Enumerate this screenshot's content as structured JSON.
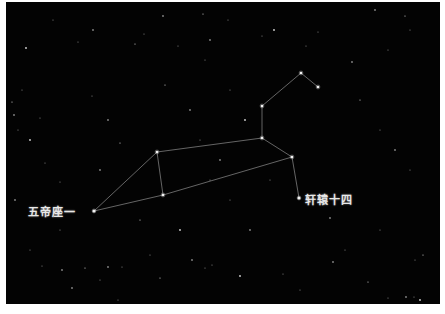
{
  "image": {
    "subject": "star-chart-constellation",
    "background_color": "#030303",
    "line_color": "#bdbdbd",
    "star_color": "#f2f2f2"
  },
  "labels": [
    {
      "text": "五帝座一",
      "x": 28,
      "y": 203
    },
    {
      "text": "轩辕十四",
      "x": 305,
      "y": 191
    }
  ],
  "constellation": {
    "vertices": {
      "A": [
        94,
        211
      ],
      "B": [
        157,
        152
      ],
      "C": [
        163,
        195
      ],
      "D": [
        262,
        138
      ],
      "E": [
        292,
        157
      ],
      "F": [
        299,
        198
      ],
      "G": [
        262,
        106
      ],
      "H": [
        301,
        73
      ],
      "I": [
        318,
        87
      ]
    },
    "edges": [
      [
        "A",
        "B"
      ],
      [
        "A",
        "C"
      ],
      [
        "B",
        "C"
      ],
      [
        "B",
        "D"
      ],
      [
        "C",
        "E"
      ],
      [
        "D",
        "E"
      ],
      [
        "E",
        "F"
      ],
      [
        "D",
        "G"
      ],
      [
        "G",
        "H"
      ],
      [
        "H",
        "I"
      ]
    ]
  },
  "background_stars": [
    [
      26,
      48
    ],
    [
      53,
      20
    ],
    [
      78,
      42
    ],
    [
      93,
      30
    ],
    [
      135,
      44
    ],
    [
      144,
      34
    ],
    [
      163,
      16
    ],
    [
      178,
      46
    ],
    [
      203,
      14
    ],
    [
      210,
      40
    ],
    [
      228,
      20
    ],
    [
      262,
      36
    ],
    [
      274,
      30
    ],
    [
      306,
      46
    ],
    [
      318,
      32
    ],
    [
      375,
      10
    ],
    [
      405,
      16
    ],
    [
      410,
      30
    ],
    [
      352,
      62
    ],
    [
      388,
      50
    ],
    [
      12,
      102
    ],
    [
      14,
      115
    ],
    [
      22,
      90
    ],
    [
      18,
      130
    ],
    [
      30,
      140
    ],
    [
      40,
      118
    ],
    [
      92,
      96
    ],
    [
      108,
      120
    ],
    [
      120,
      143
    ],
    [
      45,
      163
    ],
    [
      100,
      170
    ],
    [
      60,
      182
    ],
    [
      165,
      85
    ],
    [
      190,
      110
    ],
    [
      205,
      60
    ],
    [
      230,
      90
    ],
    [
      245,
      120
    ],
    [
      210,
      180
    ],
    [
      230,
      200
    ],
    [
      250,
      230
    ],
    [
      360,
      100
    ],
    [
      380,
      130
    ],
    [
      395,
      150
    ],
    [
      410,
      170
    ],
    [
      350,
      200
    ],
    [
      330,
      218
    ],
    [
      380,
      230
    ],
    [
      415,
      260
    ],
    [
      420,
      300
    ],
    [
      345,
      250
    ],
    [
      42,
      266
    ],
    [
      62,
      270
    ],
    [
      85,
      268
    ],
    [
      100,
      280
    ],
    [
      108,
      267
    ],
    [
      122,
      267
    ],
    [
      160,
      278
    ],
    [
      192,
      260
    ],
    [
      205,
      268
    ],
    [
      212,
      265
    ],
    [
      240,
      276
    ],
    [
      283,
      274
    ],
    [
      300,
      290
    ],
    [
      333,
      262
    ],
    [
      368,
      282
    ],
    [
      388,
      298
    ],
    [
      406,
      297
    ],
    [
      414,
      297
    ],
    [
      423,
      255
    ],
    [
      72,
      288
    ],
    [
      118,
      300
    ],
    [
      150,
      255
    ],
    [
      180,
      230
    ],
    [
      60,
      230
    ],
    [
      30,
      250
    ],
    [
      15,
      200
    ],
    [
      140,
      220
    ],
    [
      200,
      140
    ],
    [
      220,
      160
    ],
    [
      270,
      180
    ]
  ]
}
